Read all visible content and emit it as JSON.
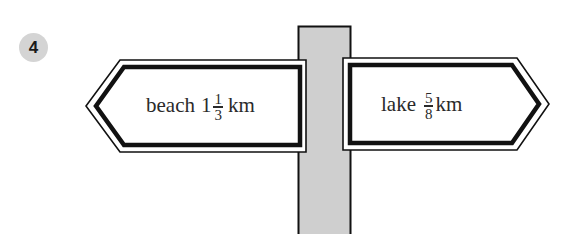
{
  "question": {
    "number": "4"
  },
  "signpost": {
    "post_color": "#cfcfcf",
    "stroke_color": "#111111",
    "signs": [
      {
        "direction": "left",
        "place": "beach",
        "whole": "1",
        "numerator": "1",
        "denominator": "3",
        "unit": "km",
        "full_text": "beach 1 1/3 km"
      },
      {
        "direction": "right",
        "place": "lake",
        "whole": "",
        "numerator": "5",
        "denominator": "8",
        "unit": "km",
        "full_text": "lake 5/8 km"
      }
    ]
  }
}
